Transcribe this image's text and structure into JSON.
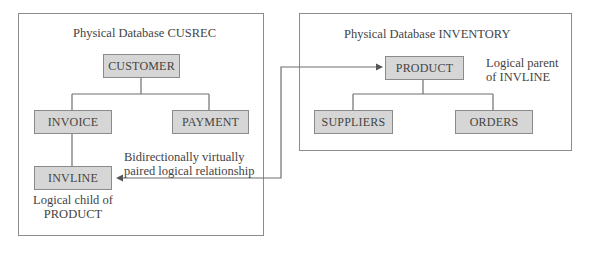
{
  "diagram": {
    "databases": [
      {
        "id": "cusrec",
        "title": "Physical Database CUSREC",
        "segments": {
          "root": "CUSTOMER",
          "child_left": "INVOICE",
          "child_right": "PAYMENT",
          "grandchild": "INVLINE"
        },
        "annotation_line1": "Logical child of",
        "annotation_line2": "PRODUCT"
      },
      {
        "id": "inventory",
        "title": "Physical Database INVENTORY",
        "segments": {
          "root": "PRODUCT",
          "child_left": "SUPPLIERS",
          "child_right": "ORDERS"
        },
        "annotation_line1": "Logical parent",
        "annotation_line2": "of INVLINE"
      }
    ],
    "relationship": {
      "label_line1": "Bidirectionally virtually",
      "label_line2": "paired logical relationship",
      "from": "INVLINE",
      "to": "PRODUCT",
      "type": "bidirectional"
    },
    "colors": {
      "segment_fill": "#d6d6d6",
      "segment_border": "#8a8a8a",
      "line": "#6f6f6f",
      "text": "#444444"
    }
  }
}
